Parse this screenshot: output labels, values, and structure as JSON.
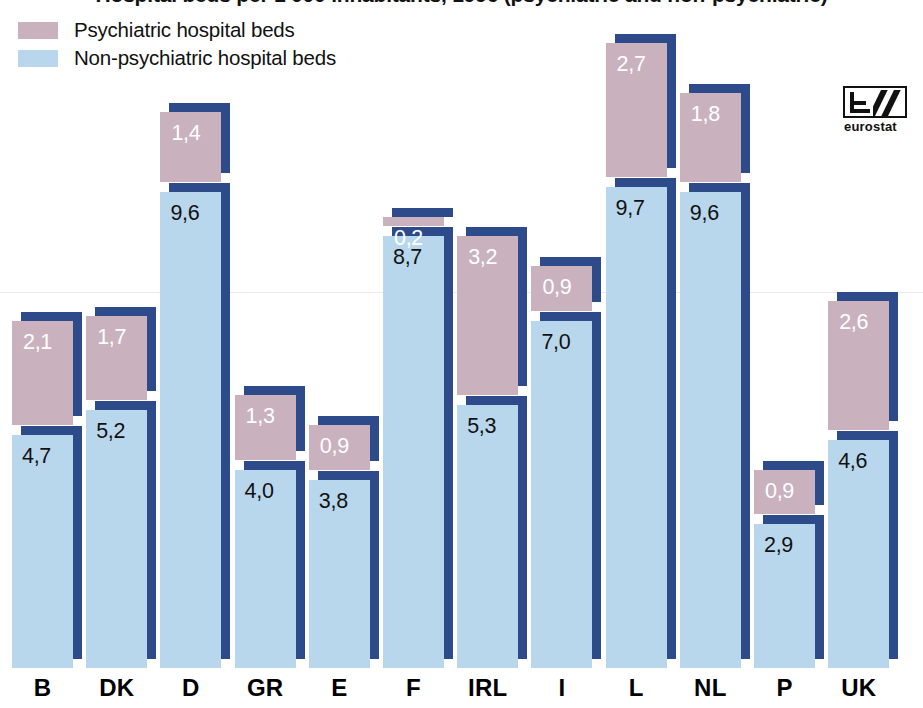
{
  "chart_data": {
    "type": "bar",
    "subtype": "stacked-bar",
    "title": "Hospital beds per 1 000 inhabitants, 1996 (psychiatric and non-psychiatric)",
    "xlabel": "",
    "ylabel": "",
    "grid": false,
    "legend_position": "top-left",
    "categories": [
      "B",
      "DK",
      "D",
      "GR",
      "E",
      "F",
      "IRL",
      "I",
      "L",
      "NL",
      "P",
      "UK"
    ],
    "series": [
      {
        "name": "Non-psychiatric hospital beds",
        "color": "#b9d7ec",
        "values": [
          4.7,
          5.2,
          9.6,
          4.0,
          3.8,
          8.7,
          5.3,
          7.0,
          9.7,
          9.6,
          2.9,
          4.6
        ],
        "labels": [
          "4,7",
          "5,2",
          "9,6",
          "4,0",
          "3,8",
          "8,7",
          "5,3",
          "7,0",
          "9,7",
          "9,6",
          "2,9",
          "4,6"
        ]
      },
      {
        "name": "Psychiatric hospital beds",
        "color": "#c9b2bd",
        "values": [
          2.1,
          1.7,
          1.4,
          1.3,
          0.9,
          0.2,
          3.2,
          0.9,
          2.7,
          1.8,
          0.9,
          2.6
        ],
        "labels": [
          "2,1",
          "1,7",
          "1,4",
          "1,3",
          "0,9",
          "0,2",
          "3,2",
          "0,9",
          "2,7",
          "1,8",
          "0,9",
          "2,6"
        ]
      }
    ],
    "totals": [
      6.8,
      6.9,
      11.0,
      5.3,
      4.7,
      8.9,
      8.5,
      7.9,
      12.4,
      11.4,
      3.8,
      7.2
    ],
    "callouts": [
      {
        "category": "F",
        "series": "Psychiatric hospital beds",
        "label": "0,2"
      }
    ]
  },
  "legend": {
    "items": [
      {
        "label": "Psychiatric hospital beds",
        "color": "#c9b2bd",
        "swatch": "psychiatric-swatch"
      },
      {
        "label": "Non-psychiatric hospital beds",
        "color": "#b9d7ec",
        "swatch": "non-psychiatric-swatch"
      }
    ]
  },
  "logo": {
    "wordmark": "eurostat",
    "icon": "eurostat-logo-icon"
  },
  "colors": {
    "psychiatric": "#c9b2bd",
    "non_psychiatric": "#b9d7ec",
    "shadow": "#2d4a8a",
    "background": "#ffffff",
    "text": "#111111",
    "value_on_pink": "#ffffff"
  }
}
